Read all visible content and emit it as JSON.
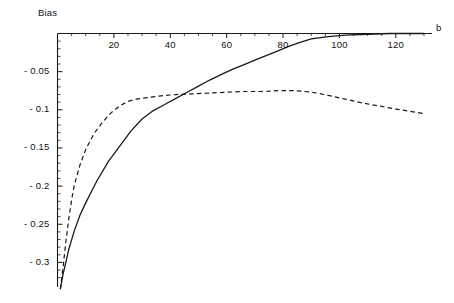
{
  "chart_data": {
    "type": "line",
    "title": "",
    "xlabel": "b",
    "ylabel": "Bias",
    "xlim": [
      0,
      130
    ],
    "ylim": [
      -0.325,
      0.004
    ],
    "grid": false,
    "legend": "none",
    "xticks": [
      20,
      40,
      60,
      80,
      100,
      120
    ],
    "xtick_labels": [
      "20",
      "40",
      "60",
      "80",
      "100",
      "120"
    ],
    "yticks": [
      -0.05,
      -0.1,
      -0.15,
      -0.2,
      -0.25,
      -0.3
    ],
    "ytick_labels": [
      "- 0.05",
      "- 0.1",
      "- 0.15",
      "- 0.2",
      "- 0.25",
      "- 0.3"
    ],
    "axis_position": {
      "x_axis": "top",
      "y_axis": "left"
    },
    "series": [
      {
        "name": "solid-curve",
        "style": "solid",
        "color": "#1a1a1a",
        "x": [
          1,
          2,
          4,
          6,
          8,
          10,
          14,
          18,
          22,
          24,
          26,
          30,
          34,
          38,
          42,
          46,
          50,
          54,
          58,
          62,
          66,
          70,
          74,
          78,
          82,
          85,
          90,
          96,
          102,
          110,
          118,
          126,
          130
        ],
        "y": [
          -0.335,
          -0.315,
          -0.283,
          -0.258,
          -0.238,
          -0.222,
          -0.193,
          -0.168,
          -0.148,
          -0.138,
          -0.128,
          -0.112,
          -0.101,
          -0.093,
          -0.085,
          -0.077,
          -0.069,
          -0.061,
          -0.054,
          -0.047,
          -0.041,
          -0.035,
          -0.029,
          -0.023,
          -0.017,
          -0.013,
          -0.007,
          -0.004,
          -0.002,
          -0.001,
          0.0,
          0.0,
          0.0
        ]
      },
      {
        "name": "dashed-curve",
        "style": "dashed",
        "color": "#1a1a1a",
        "x": [
          1,
          2,
          3,
          4,
          5,
          6,
          8,
          10,
          13,
          16,
          19,
          22,
          25,
          28,
          32,
          36,
          42,
          48,
          54,
          60,
          66,
          72,
          78,
          84,
          88,
          92,
          96,
          102,
          108,
          114,
          120,
          125,
          130
        ],
        "y": [
          -0.335,
          -0.305,
          -0.272,
          -0.243,
          -0.218,
          -0.198,
          -0.172,
          -0.152,
          -0.131,
          -0.116,
          -0.104,
          -0.095,
          -0.089,
          -0.086,
          -0.084,
          -0.082,
          -0.08,
          -0.079,
          -0.078,
          -0.077,
          -0.076,
          -0.076,
          -0.075,
          -0.075,
          -0.076,
          -0.078,
          -0.081,
          -0.086,
          -0.091,
          -0.095,
          -0.099,
          -0.102,
          -0.105
        ]
      }
    ]
  }
}
